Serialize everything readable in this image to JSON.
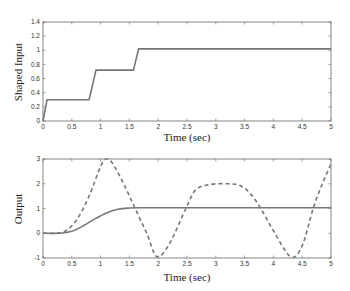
{
  "chart_data": [
    {
      "type": "line",
      "title": "",
      "xlabel": "Time (sec)",
      "ylabel": "Shaped Input",
      "xlim": [
        0,
        5
      ],
      "ylim": [
        0,
        1.4
      ],
      "xticks": [
        "0",
        "0.5",
        "1",
        "1.5",
        "2",
        "2.5",
        "3",
        "3.5",
        "4",
        "4.5",
        "5"
      ],
      "yticks": [
        "0",
        "0.2",
        "0.4",
        "0.6",
        "0.8",
        "1",
        "1.2",
        "1.4"
      ],
      "grid": false,
      "series": [
        {
          "name": "Shaped Input",
          "style": "solid",
          "color": "#777777",
          "x": [
            0,
            0.07,
            0.8,
            0.92,
            1.57,
            1.66,
            5
          ],
          "y": [
            0,
            0.3,
            0.3,
            0.72,
            0.72,
            1.02,
            1.02
          ]
        }
      ]
    },
    {
      "type": "line",
      "title": "",
      "xlabel": "Time (sec)",
      "ylabel": "Output",
      "xlim": [
        0,
        5
      ],
      "ylim": [
        -1,
        3
      ],
      "xticks": [
        "0",
        "0.5",
        "1",
        "1.5",
        "2",
        "2.5",
        "3",
        "3.5",
        "4",
        "4.5",
        "5"
      ],
      "yticks": [
        "-1",
        "0",
        "1",
        "2",
        "3"
      ],
      "grid": false,
      "series": [
        {
          "name": "Shaped response",
          "style": "solid",
          "color": "#777777",
          "x": [
            0,
            0.3,
            0.5,
            0.7,
            0.9,
            1.1,
            1.3,
            1.5,
            1.7,
            2,
            3,
            4,
            5
          ],
          "y": [
            0,
            0.0,
            0.08,
            0.3,
            0.58,
            0.82,
            0.97,
            1.02,
            1.03,
            1.03,
            1.03,
            1.03,
            1.03
          ]
        },
        {
          "name": "Unshaped response",
          "style": "dashed",
          "color": "#777777",
          "x": [
            0,
            0.2,
            0.4,
            0.6,
            0.8,
            1.0,
            1.1,
            1.2,
            1.4,
            1.6,
            1.8,
            1.98,
            2.2,
            2.48,
            2.65,
            2.9,
            3.2,
            3.42,
            3.6,
            3.78,
            4.0,
            4.3,
            4.5,
            4.69,
            4.85,
            5.0
          ],
          "y": [
            0,
            0.0,
            0.1,
            0.6,
            1.5,
            2.7,
            3.0,
            2.85,
            2.0,
            1.0,
            0.0,
            -0.95,
            -0.4,
            1.0,
            1.75,
            1.97,
            2.0,
            1.93,
            1.6,
            1.0,
            0.1,
            -0.95,
            -0.5,
            1.0,
            2.0,
            2.8
          ]
        }
      ]
    }
  ]
}
